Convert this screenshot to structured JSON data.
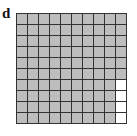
{
  "panel_label": "d",
  "grid": {
    "rows": 10,
    "cols": 10,
    "shaded_count": 96,
    "unshaded_count": 4,
    "shaded_color": "#bdbdbd",
    "unshaded_color": "#ffffff",
    "line_color": "#333333",
    "unshaded_cells": [
      [
        6,
        9
      ],
      [
        7,
        9
      ],
      [
        8,
        9
      ],
      [
        9,
        9
      ]
    ]
  }
}
